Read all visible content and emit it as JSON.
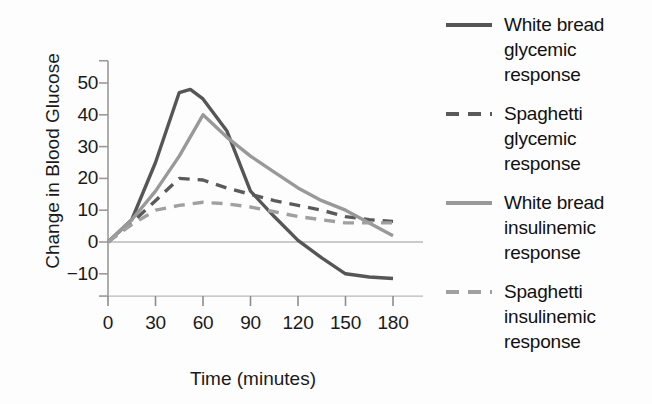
{
  "chart_data": {
    "type": "line",
    "title": "",
    "xlabel": "Time (minutes)",
    "ylabel": "Change in Blood Glucose",
    "xlim": [
      0,
      180
    ],
    "ylim": [
      -17,
      57
    ],
    "xticks": [
      0,
      30,
      60,
      90,
      120,
      150,
      180
    ],
    "xtick_labels": [
      "0",
      "30",
      "60",
      "90",
      "120",
      "150",
      "180"
    ],
    "yticks": [
      -10,
      0,
      10,
      20,
      30,
      40,
      50
    ],
    "ytick_labels": [
      "−10",
      "0",
      "10",
      "20",
      "30",
      "40",
      "50"
    ],
    "grid": false,
    "zero_line": true,
    "legend_position": "right",
    "series": [
      {
        "name": "White bread glycemic response",
        "label": "White bread\nglycemic\nresponse",
        "style": "solid",
        "color": "#565656",
        "width": 3.4,
        "x": [
          0,
          15,
          30,
          45,
          52,
          60,
          75,
          90,
          105,
          120,
          135,
          150,
          165,
          180
        ],
        "y": [
          0,
          7,
          25,
          47,
          48,
          45,
          35,
          16,
          8,
          0.5,
          -5,
          -10,
          -11,
          -11.5
        ]
      },
      {
        "name": "Spaghetti glycemic response",
        "label": "Spaghetti\nglycemic\nresponse",
        "style": "dashed",
        "color": "#5a5a5a",
        "width": 3.4,
        "x": [
          0,
          15,
          30,
          45,
          60,
          75,
          90,
          105,
          120,
          135,
          150,
          165,
          180
        ],
        "y": [
          0,
          6,
          13,
          20,
          19.5,
          17,
          15,
          13,
          11.5,
          10,
          8,
          7,
          6.5
        ]
      },
      {
        "name": "White bread insulinemic response",
        "label": "White bread\ninsulinemic\nresponse",
        "style": "solid",
        "color": "#999999",
        "width": 3.4,
        "x": [
          0,
          15,
          30,
          45,
          60,
          75,
          90,
          105,
          120,
          135,
          150,
          165,
          180
        ],
        "y": [
          0,
          7,
          16,
          27,
          40,
          33,
          27,
          22,
          17,
          13,
          10,
          6,
          2
        ]
      },
      {
        "name": "Spaghetti insulinemic response",
        "label": "Spaghetti\ninsulinemic\nresponse",
        "style": "dashed",
        "color": "#a0a0a0",
        "width": 3.4,
        "x": [
          0,
          15,
          30,
          45,
          60,
          75,
          90,
          105,
          120,
          135,
          150,
          165,
          180
        ],
        "y": [
          0,
          5.5,
          10,
          11.5,
          12.5,
          12,
          11,
          9.5,
          8,
          7,
          6,
          6,
          6
        ]
      }
    ]
  },
  "axes": {
    "xlabel": "Time (minutes)",
    "ylabel": "Change in Blood Glucose"
  }
}
